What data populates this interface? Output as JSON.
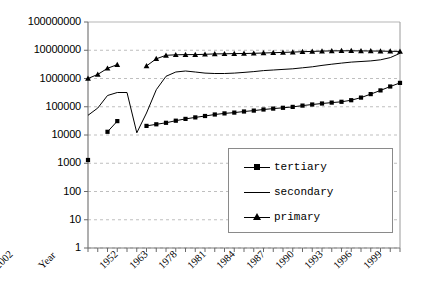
{
  "chart_data": {
    "type": "line",
    "title": "",
    "xlabel": "Year",
    "ylabel": "",
    "log_scale_y": true,
    "ylim": [
      1,
      100000000
    ],
    "grid": true,
    "legend_position": "inside-bottom-right",
    "y_ticks": [
      "1",
      "10",
      "100",
      "1000",
      "10000",
      "100000",
      "1000000",
      "10000000",
      "100000000"
    ],
    "x_tick_labels": [
      "Year",
      "1952",
      "1963",
      "1978",
      "1981",
      "1984",
      "1987",
      "1990",
      "1993",
      "1996",
      "1999",
      "2002"
    ],
    "x": [
      1949,
      1952,
      1957,
      1960,
      1962,
      1965,
      1978,
      1979,
      1980,
      1981,
      1982,
      1983,
      1984,
      1985,
      1986,
      1987,
      1988,
      1989,
      1990,
      1991,
      1992,
      1993,
      1994,
      1995,
      1996,
      1997,
      1998,
      1999,
      2000,
      2001,
      2002,
      2003,
      2004
    ],
    "series": [
      {
        "name": "primary",
        "marker": "triangle",
        "values": [
          1000000,
          1400000,
          2300000,
          3100000,
          null,
          null,
          2800000,
          5000000,
          6600000,
          6900000,
          7000000,
          7000000,
          7200000,
          7400000,
          7500000,
          7600000,
          7700000,
          7800000,
          8000000,
          8200000,
          8400000,
          8600000,
          8900000,
          9100000,
          9300000,
          9500000,
          9600000,
          9600000,
          9500000,
          9400000,
          9300000,
          9200000,
          9100000
        ]
      },
      {
        "name": "secondary",
        "marker": "none",
        "values": [
          50000,
          90000,
          250000,
          320000,
          320000,
          12000,
          60000,
          400000,
          1200000,
          1700000,
          1850000,
          1700000,
          1550000,
          1500000,
          1500000,
          1550000,
          1650000,
          1750000,
          1900000,
          2000000,
          2100000,
          2200000,
          2400000,
          2600000,
          2900000,
          3200000,
          3500000,
          3800000,
          4000000,
          4200000,
          4600000,
          5500000,
          7800000
        ]
      },
      {
        "name": "tertiary",
        "marker": "square",
        "values": [
          1300,
          null,
          13000,
          31000,
          null,
          null,
          21000,
          24000,
          27000,
          32000,
          37000,
          42000,
          47000,
          53000,
          58000,
          62000,
          68000,
          73000,
          80000,
          86000,
          92000,
          99000,
          110000,
          120000,
          130000,
          140000,
          150000,
          170000,
          210000,
          280000,
          380000,
          520000,
          700000
        ]
      }
    ]
  },
  "axis": {
    "y_tick_labels": [
      "100000000",
      "10000000",
      "1000000",
      "100000",
      "10000",
      "1000",
      "100",
      "10",
      "1"
    ],
    "x_tick_labels": [
      "Year",
      "1952",
      "1963",
      "1978",
      "1981",
      "1984",
      "1987",
      "1990",
      "1993",
      "1996",
      "1999",
      "2002"
    ]
  },
  "legend": {
    "items": [
      {
        "label": "tertiary",
        "marker": "square"
      },
      {
        "label": "secondary",
        "marker": "line"
      },
      {
        "label": "primary",
        "marker": "triangle"
      }
    ]
  },
  "colors": {
    "series": "#000000",
    "grid": "#bfbfbf",
    "axis": "#808080",
    "background": "#ffffff"
  }
}
